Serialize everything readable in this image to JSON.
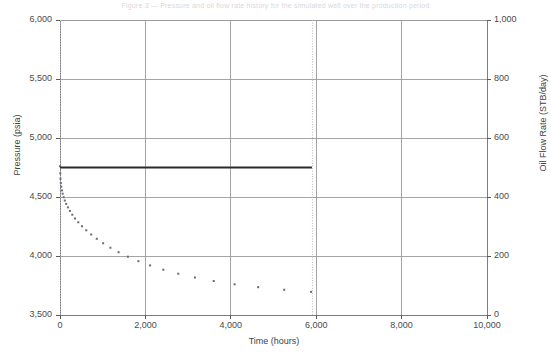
{
  "figure": {
    "top_caption": "Figure 3 — Pressure and oil flow rate history for the simulated well over the production period",
    "background": "#ffffff"
  },
  "chart_data": {
    "type": "line",
    "title": "",
    "xlabel": "Time (hours)",
    "ylabel": "Pressure (psia)",
    "y2label": "Oil Flow Rate (STB/day)",
    "xlim": [
      0,
      10000
    ],
    "ylim": [
      3500,
      6000
    ],
    "y2lim": [
      0,
      1000
    ],
    "xticks": [
      0,
      2000,
      4000,
      6000,
      8000,
      10000
    ],
    "xticklabels": [
      "0",
      "2,000",
      "4,000",
      "6,000",
      "8,000",
      "10,000"
    ],
    "yticks": [
      3500,
      4000,
      4500,
      5000,
      5500,
      6000
    ],
    "yticklabels": [
      "3,500",
      "4,000",
      "4,500",
      "5,000",
      "5,500",
      "6,000"
    ],
    "y2ticks": [
      0,
      200,
      400,
      600,
      800,
      1000
    ],
    "y2ticklabels": [
      "0",
      "200",
      "400",
      "600",
      "800",
      "1,000"
    ],
    "grid": true,
    "grid_color": "#9a9a9a",
    "legend": "none",
    "colors": {
      "pressure": "#6a6a72",
      "flow_rate": "#2b2b2b",
      "grid": "#9a9a9a",
      "frame": "#7d7d7d",
      "marker_line": "#b9b9bf"
    },
    "annotations": [
      {
        "name": "production-start-marker",
        "type": "vline",
        "x": 0,
        "style": "dotted",
        "color": "#b9b9bf"
      },
      {
        "name": "production-end-marker",
        "type": "vline",
        "x": 5900,
        "style": "dotted",
        "color": "#b9b9bf"
      }
    ],
    "series": [
      {
        "name": "Pressure",
        "axis": "left",
        "style": "scatter",
        "marker": "square",
        "marker_size": 2,
        "color": "#6a6a72",
        "points": [
          [
            2,
            4760
          ],
          [
            6,
            4700
          ],
          [
            12,
            4655
          ],
          [
            20,
            4618
          ],
          [
            30,
            4588
          ],
          [
            45,
            4556
          ],
          [
            62,
            4528
          ],
          [
            85,
            4498
          ],
          [
            112,
            4470
          ],
          [
            145,
            4442
          ],
          [
            185,
            4412
          ],
          [
            232,
            4382
          ],
          [
            288,
            4350
          ],
          [
            352,
            4318
          ],
          [
            428,
            4286
          ],
          [
            515,
            4252
          ],
          [
            615,
            4218
          ],
          [
            730,
            4182
          ],
          [
            862,
            4146
          ],
          [
            1010,
            4108
          ],
          [
            1180,
            4070
          ],
          [
            1372,
            4032
          ],
          [
            1590,
            3994
          ],
          [
            1835,
            3956
          ],
          [
            2110,
            3920
          ],
          [
            2420,
            3884
          ],
          [
            2770,
            3850
          ],
          [
            3160,
            3818
          ],
          [
            3600,
            3788
          ],
          [
            4090,
            3760
          ],
          [
            4640,
            3736
          ],
          [
            5250,
            3714
          ],
          [
            5880,
            3696
          ]
        ]
      },
      {
        "name": "Oil Flow Rate",
        "axis": "right",
        "style": "line",
        "line_width": 2,
        "color": "#2b2b2b",
        "points": [
          [
            0,
            500
          ],
          [
            500,
            500
          ],
          [
            1000,
            500
          ],
          [
            1500,
            500
          ],
          [
            2000,
            500
          ],
          [
            2500,
            500
          ],
          [
            3000,
            500
          ],
          [
            3500,
            500
          ],
          [
            4000,
            500
          ],
          [
            4500,
            500
          ],
          [
            5000,
            500
          ],
          [
            5500,
            500
          ],
          [
            5900,
            500
          ]
        ]
      }
    ]
  }
}
